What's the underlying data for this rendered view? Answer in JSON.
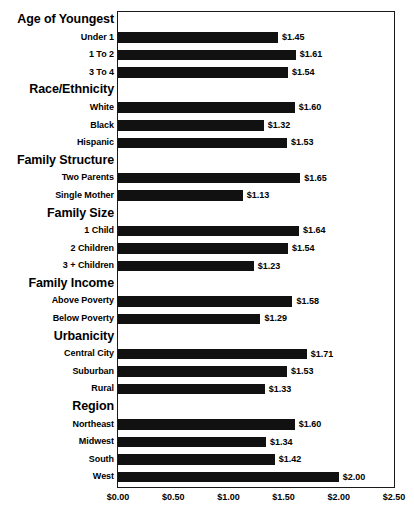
{
  "chart_data": {
    "type": "bar",
    "orientation": "horizontal",
    "title": "",
    "xlabel": "",
    "ylabel": "",
    "xlim": [
      0,
      2.5
    ],
    "xticks": [
      "$0.00",
      "$0.50",
      "$1.00",
      "$1.50",
      "$2.00",
      "$2.50"
    ],
    "xtick_values": [
      0,
      0.5,
      1.0,
      1.5,
      2.0,
      2.5
    ],
    "grid": false,
    "legend": null,
    "value_prefix": "$",
    "bar_color": "#111111",
    "frame_color": "#1a1a1a",
    "groups": [
      {
        "header": "Age of Youngest",
        "categories": [
          "Under 1",
          "1 To 2",
          "3 To 4"
        ],
        "values": [
          1.45,
          1.61,
          1.54
        ],
        "labels": [
          "$1.45",
          "$1.61",
          "$1.54"
        ]
      },
      {
        "header": "Race/Ethnicity",
        "categories": [
          "White",
          "Black",
          "Hispanic"
        ],
        "values": [
          1.6,
          1.32,
          1.53
        ],
        "labels": [
          "$1.60",
          "$1.32",
          "$1.53"
        ]
      },
      {
        "header": "Family Structure",
        "categories": [
          "Two Parents",
          "Single Mother"
        ],
        "values": [
          1.65,
          1.13
        ],
        "labels": [
          "$1.65",
          "$1.13"
        ]
      },
      {
        "header": "Family Size",
        "categories": [
          "1 Child",
          "2 Children",
          "3 + Children"
        ],
        "values": [
          1.64,
          1.54,
          1.23
        ],
        "labels": [
          "$1.64",
          "$1.54",
          "$1.23"
        ]
      },
      {
        "header": "Family Income",
        "categories": [
          "Above Poverty",
          "Below Poverty"
        ],
        "values": [
          1.58,
          1.29
        ],
        "labels": [
          "$1.58",
          "$1.29"
        ]
      },
      {
        "header": "Urbanicity",
        "categories": [
          "Central City",
          "Suburban",
          "Rural"
        ],
        "values": [
          1.71,
          1.53,
          1.33
        ],
        "labels": [
          "$1.71",
          "$1.53",
          "$1.33"
        ]
      },
      {
        "header": "Region",
        "categories": [
          "Northeast",
          "Midwest",
          "South",
          "West"
        ],
        "values": [
          1.6,
          1.34,
          1.42,
          2.0
        ],
        "labels": [
          "$1.60",
          "$1.34",
          "$1.42",
          "$2.00"
        ]
      }
    ]
  }
}
